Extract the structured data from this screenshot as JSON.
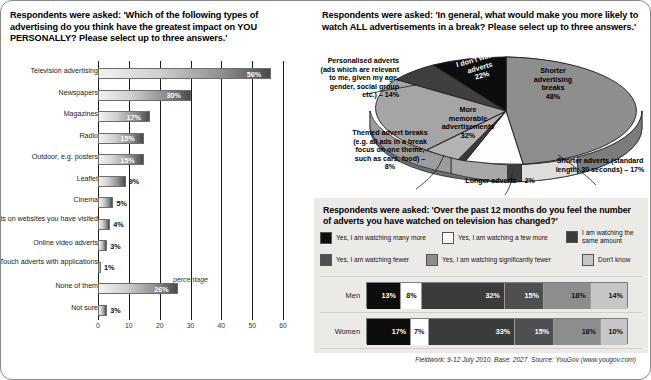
{
  "left": {
    "question": "Respondents were asked: 'Which of the following types of advertising do you think have the greatest impact on YOU PERSONALLY? Please select up to three answers.'",
    "axis_title": "percentage"
  },
  "pie": {
    "question": "Respondents were asked: 'In general, what would make you more likely to watch ALL advertisements in a break? Please select up to three answers.'",
    "labels": {
      "shorter_breaks": "Shorter advertising breaks 48%",
      "shorter_breaks_l1": "Shorter",
      "shorter_breaks_l2": "advertising",
      "shorter_breaks_l3": "breaks",
      "shorter_breaks_val": "48%",
      "memorable_l1": "More",
      "memorable_l2": "memorable",
      "memorable_l3": "advertisements",
      "memorable_val": "32%",
      "dont_watch_l1": "I don't watch",
      "dont_watch_l2": "adverts",
      "dont_watch_val": "22%",
      "personalised": "Personalised adverts (ads which are relevant to me, given my age, gender, social group etc.) – 14%",
      "themed": "Themed advert breaks (e.g. all ads in a break focus on one theme, such as cars, food) – 8%",
      "longer": "Longer adverts – 2%",
      "shorter_adverts": "Shorter adverts (standard length: 30 seconds) – 17%"
    }
  },
  "stack": {
    "question": "Respondents were asked: 'Over the past 12 months do you feel the number of adverts you have watched on television has changed?'"
  },
  "footer": "Fieldwork: 9-12 July 2010. Base: 2027. Source: YouGov (www.yougov.com)",
  "chart_data": [
    {
      "type": "bar",
      "orientation": "horizontal",
      "title": "Which of the following types of advertising do you think have the greatest impact on YOU PERSONALLY?",
      "xlabel": "percentage",
      "ylabel": "",
      "xlim": [
        0,
        60
      ],
      "xticks": [
        "0",
        "10",
        "20",
        "30",
        "40",
        "50",
        "60"
      ],
      "grid": true,
      "categories": [
        "Television advertising",
        "Newspapers",
        "Magazines",
        "Radio",
        "Outdoor, e.g. posters",
        "Leaflet",
        "Cinema",
        "Banner adverts on websites you have visited",
        "Online video adverts",
        "iPhone/iPad/iPod Touch adverts with applications",
        "None of them",
        "Not sure"
      ],
      "values": [
        56,
        30,
        17,
        15,
        15,
        9,
        5,
        4,
        3,
        1,
        26,
        3
      ],
      "value_labels": [
        "56%",
        "30%",
        "17%",
        "15%",
        "15%",
        "9%",
        "5%",
        "4%",
        "3%",
        "1%",
        "26%",
        "3%"
      ]
    },
    {
      "type": "pie",
      "title": "In general, what would make you more likely to watch ALL advertisements in a break?",
      "legend": "callout-labels",
      "categories": [
        "Shorter advertising breaks",
        "Shorter adverts (standard length: 30 seconds)",
        "Longer adverts",
        "Themed advert breaks (e.g. all ads in a break focus on one theme, such as cars, food)",
        "More memorable advertisements",
        "Personalised adverts (ads which are relevant to me, given my age, gender, social group etc.)",
        "I don't watch adverts"
      ],
      "values": [
        48,
        17,
        2,
        8,
        32,
        14,
        22
      ],
      "value_labels": [
        "48%",
        "17%",
        "2%",
        "8%",
        "32%",
        "14%",
        "22%"
      ]
    },
    {
      "type": "bar",
      "orientation": "horizontal-stacked-100",
      "title": "Over the past 12 months do you feel the number of adverts you have watched on television has changed?",
      "categories": [
        "Men",
        "Women"
      ],
      "series": [
        {
          "name": "Yes, I am watching many more",
          "color": "#0d0d0d",
          "values": [
            13,
            17
          ]
        },
        {
          "name": "Yes, I am watching a few more",
          "color": "#ffffff",
          "values": [
            8,
            7
          ]
        },
        {
          "name": "I am watching the same amount",
          "color": "#3b3b3b",
          "values": [
            32,
            33
          ]
        },
        {
          "name": "Yes, I am watching fewer",
          "color": "#4f4f4f",
          "values": [
            15,
            15
          ]
        },
        {
          "name": "Yes, I am watching significantly fewer",
          "color": "#8d8d8d",
          "values": [
            18,
            18
          ]
        },
        {
          "name": "Don't know",
          "color": "#c6c6c6",
          "values": [
            14,
            10
          ]
        }
      ],
      "value_labels": {
        "Men": [
          "13%",
          "8%",
          "32%",
          "15%",
          "18%",
          "14%"
        ],
        "Women": [
          "17%",
          "7%",
          "33%",
          "15%",
          "18%",
          "10%"
        ]
      }
    }
  ],
  "legend": [
    {
      "label": "Yes, I am watching many more",
      "color": "#0d0d0d"
    },
    {
      "label": "Yes, I am watching a few more",
      "color": "#ffffff"
    },
    {
      "label": "I am watching the same amount",
      "color": "#3b3b3b"
    },
    {
      "label": "Yes, I am watching fewer",
      "color": "#4f4f4f"
    },
    {
      "label": "Yes, I am watching significantly fewer",
      "color": "#8d8d8d"
    },
    {
      "label": "Don't know",
      "color": "#c6c6c6"
    }
  ],
  "row_names": [
    "Men",
    "Women"
  ]
}
